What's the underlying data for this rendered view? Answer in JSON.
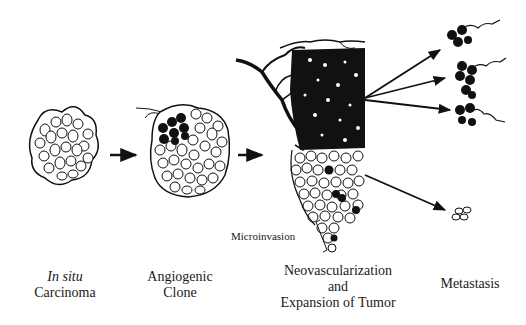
{
  "diagram": {
    "stages": [
      {
        "id": "in-situ",
        "label_italic": "In situ",
        "label": "Carcinoma"
      },
      {
        "id": "angiogenic-clone",
        "label_line1": "Angiogenic",
        "label_line2": "Clone"
      },
      {
        "id": "neovascularization",
        "label_line1": "Neovascularization",
        "label_line2": "and",
        "label_line3": "Expansion of Tumor"
      },
      {
        "id": "metastasis",
        "label": "Metastasis"
      }
    ],
    "annotations": {
      "microinvasion": "Microinvasion"
    },
    "colors": {
      "ink": "#111111",
      "background": "#ffffff"
    }
  }
}
